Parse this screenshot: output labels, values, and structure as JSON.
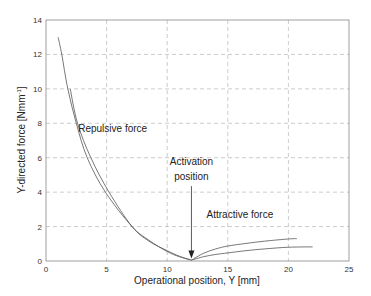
{
  "chart_data": {
    "type": "line",
    "title": "",
    "xlabel": "Operational position, Y [mm]",
    "ylabel": "Y-directed force [Nmm",
    "ylabel_sup": "-1",
    "ylabel_end": "]",
    "xlim": [
      0,
      25
    ],
    "ylim": [
      0,
      14
    ],
    "x_ticks": [
      0,
      5,
      10,
      15,
      20,
      25
    ],
    "y_ticks": [
      0,
      2,
      4,
      6,
      8,
      10,
      12,
      14
    ],
    "grid": true,
    "legend": null,
    "series": [
      {
        "name": "Repulsive force (curve 1)",
        "x": [
          1.0,
          1.3,
          1.8,
          2.5,
          3.4,
          4.9,
          7.1,
          8.5,
          10.0,
          11.0,
          12.0
        ],
        "y": [
          13.0,
          12.0,
          10.0,
          8.0,
          6.0,
          4.0,
          2.0,
          1.2,
          0.55,
          0.25,
          0.05
        ]
      },
      {
        "name": "Repulsive force (curve 2)",
        "x": [
          2.0,
          2.6,
          3.7,
          5.2,
          7.1,
          8.5,
          10.0,
          11.0,
          12.0
        ],
        "y": [
          10.0,
          8.0,
          6.0,
          4.0,
          2.0,
          1.15,
          0.6,
          0.28,
          0.05
        ]
      },
      {
        "name": "Attractive force (curve 1)",
        "x": [
          12.0,
          13.0,
          14.0,
          15.0,
          16.5,
          18.0,
          20.0,
          20.7
        ],
        "y": [
          0.05,
          0.45,
          0.7,
          0.87,
          1.02,
          1.15,
          1.28,
          1.3
        ]
      },
      {
        "name": "Attractive force (curve 2)",
        "x": [
          12.0,
          13.0,
          14.0,
          15.0,
          16.5,
          18.0,
          20.0,
          22.0
        ],
        "y": [
          0.05,
          0.25,
          0.38,
          0.47,
          0.6,
          0.7,
          0.8,
          0.82
        ]
      }
    ],
    "annotations": [
      {
        "text": "Repulsive force",
        "x": 5.5,
        "y": 7.5
      },
      {
        "text": "Activation",
        "x": 12.0,
        "y": 5.6
      },
      {
        "text": "position",
        "x": 12.0,
        "y": 4.7
      },
      {
        "text": "Attractive force",
        "x": 16.0,
        "y": 2.5
      }
    ],
    "arrow": {
      "from": [
        12.0,
        4.7
      ],
      "to": [
        12.0,
        0.15
      ],
      "label": "Activation position"
    }
  }
}
